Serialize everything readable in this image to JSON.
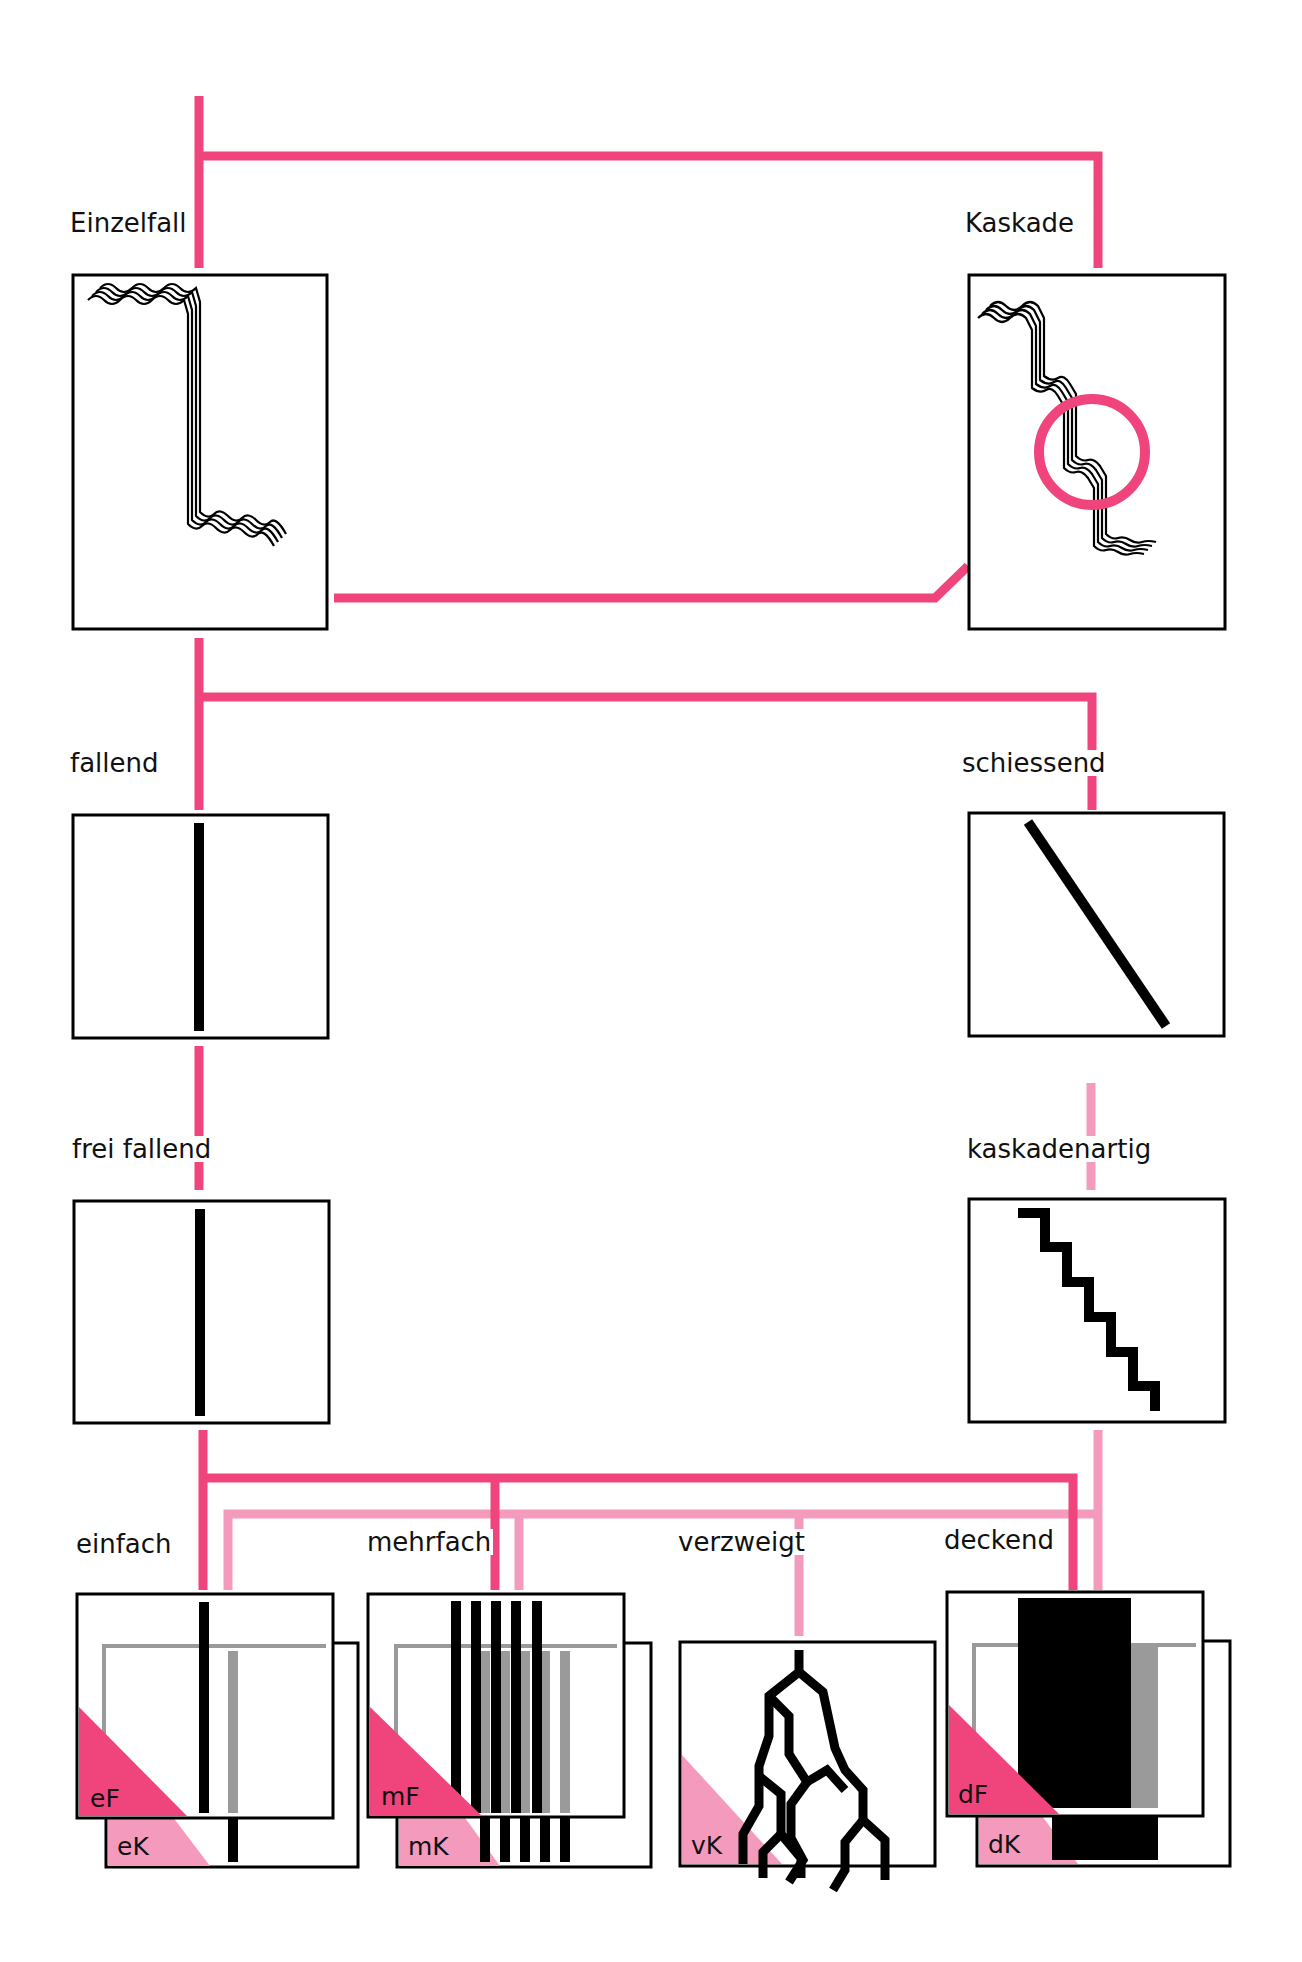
{
  "colors": {
    "primary_line": "#f0457c",
    "secondary_line": "#f49bbd",
    "ink": "#000000",
    "gray": "#9a9a9a",
    "background": "#ffffff"
  },
  "nodes": {
    "einzelfall": "Einzelfall",
    "kaskade": "Kaskade",
    "fallend": "fallend",
    "schiessend": "schiessend",
    "frei_fallend": "frei fallend",
    "kaskadenartig": "kaskadenartig",
    "einfach": "einfach",
    "mehrfach": "mehrfach",
    "verzweigt": "verzweigt",
    "deckend": "deckend"
  },
  "tags": {
    "eF": "eF",
    "eK": "eK",
    "mF": "mF",
    "mK": "mK",
    "vK": "vK",
    "dF": "dF",
    "dK": "dK"
  }
}
